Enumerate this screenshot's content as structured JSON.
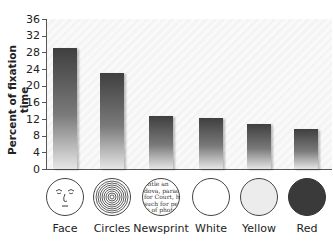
{
  "chart_data": {
    "type": "bar",
    "title": "",
    "xlabel": "",
    "ylabel": "Percent of fixation time",
    "ylim": [
      0,
      36
    ],
    "yticks": [
      0,
      4,
      8,
      12,
      16,
      20,
      24,
      28,
      32,
      36
    ],
    "grid": false,
    "categories": [
      "Face",
      "Circles",
      "Newsprint",
      "White",
      "Yellow",
      "Red"
    ],
    "values": [
      29,
      23,
      12.8,
      12.2,
      10.8,
      9.7
    ],
    "stimulus_icons": [
      "face-drawing",
      "concentric-circles",
      "newsprint-text",
      "white-disc",
      "yellow-disc",
      "red-disc"
    ]
  },
  "axis": {
    "ylabel": "Percent of fixation time",
    "ticks": [
      "0",
      "4",
      "8",
      "12",
      "16",
      "20",
      "24",
      "28",
      "32",
      "36"
    ]
  },
  "labels": [
    "Face",
    "Circles",
    "Newsprint",
    "White",
    "Yellow",
    "Red"
  ],
  "newsprint_text": [
    "ontle an",
    "dova, parade",
    "for Court, hol",
    "such for perso",
    "ts of photog",
    "to lato"
  ],
  "colors": {
    "bar_dark": "#3f3f3f",
    "bar_light": "#e6e6e6",
    "white_disc": "#ffffff",
    "yellow_disc": "#ececec",
    "red_disc": "#3a3a3a"
  }
}
